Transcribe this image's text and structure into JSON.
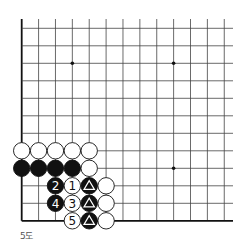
{
  "diagram": {
    "caption": "5도",
    "board": {
      "grid": {
        "x0": 21.7,
        "dx": 16.88,
        "cols": 13,
        "y0": 28.3,
        "dy": 17.5,
        "rows": 12,
        "extend_top": 19,
        "extend_right": 233,
        "line_color": "#444444",
        "edge_color": "#111111"
      },
      "edges": [
        "left",
        "bottom"
      ],
      "star_points": [
        {
          "col": 3,
          "row": 2
        },
        {
          "col": 9,
          "row": 2
        },
        {
          "col": 9,
          "row": 8
        }
      ],
      "stones": [
        {
          "col": 0,
          "row": 7,
          "color": "white"
        },
        {
          "col": 1,
          "row": 7,
          "color": "white"
        },
        {
          "col": 2,
          "row": 7,
          "color": "white"
        },
        {
          "col": 3,
          "row": 7,
          "color": "white"
        },
        {
          "col": 4,
          "row": 7,
          "color": "white"
        },
        {
          "col": 0,
          "row": 8,
          "color": "black"
        },
        {
          "col": 1,
          "row": 8,
          "color": "black"
        },
        {
          "col": 2,
          "row": 8,
          "color": "black"
        },
        {
          "col": 3,
          "row": 8,
          "color": "black"
        },
        {
          "col": 4,
          "row": 8,
          "color": "white"
        },
        {
          "col": 2,
          "row": 9,
          "color": "black",
          "label": "2"
        },
        {
          "col": 3,
          "row": 9,
          "color": "white",
          "label": "1"
        },
        {
          "col": 4,
          "row": 9,
          "color": "black",
          "mark": "triangle"
        },
        {
          "col": 5,
          "row": 9,
          "color": "white"
        },
        {
          "col": 2,
          "row": 10,
          "color": "black",
          "label": "4"
        },
        {
          "col": 3,
          "row": 10,
          "color": "white",
          "label": "3"
        },
        {
          "col": 4,
          "row": 10,
          "color": "black",
          "mark": "triangle"
        },
        {
          "col": 5,
          "row": 10,
          "color": "white"
        },
        {
          "col": 3,
          "row": 11,
          "color": "white",
          "label": "5"
        },
        {
          "col": 4,
          "row": 11,
          "color": "black",
          "mark": "triangle"
        },
        {
          "col": 5,
          "row": 11,
          "color": "white"
        }
      ]
    }
  }
}
